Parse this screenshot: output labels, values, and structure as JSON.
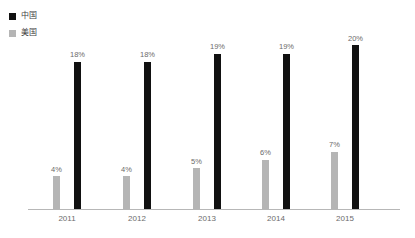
{
  "chart_data": {
    "type": "bar",
    "title": "",
    "xlabel": "",
    "ylabel": "",
    "categories": [
      "2011",
      "2012",
      "2013",
      "2014",
      "2015"
    ],
    "ylim": [
      0,
      22
    ],
    "grid": false,
    "legend_position": "top-left",
    "value_suffix": "%",
    "series": [
      {
        "name": "中国",
        "color": "#111111",
        "values": [
          18,
          18,
          19,
          19,
          20
        ],
        "labels": [
          "18%",
          "18%",
          "19%",
          "19%",
          "20%"
        ]
      },
      {
        "name": "美国",
        "color": "#b5b5b5",
        "values": [
          4,
          4,
          5,
          6,
          7
        ],
        "labels": [
          "4%",
          "4%",
          "5%",
          "6%",
          "7%"
        ]
      }
    ]
  },
  "legend": {
    "items": [
      {
        "label": "中国",
        "color": "#111111"
      },
      {
        "label": "美国",
        "color": "#b5b5b5"
      }
    ]
  },
  "axis": {
    "tick_labels": [
      "2011",
      "2012",
      "2013",
      "2014",
      "2015"
    ],
    "line_color": "#b7b7b7"
  }
}
